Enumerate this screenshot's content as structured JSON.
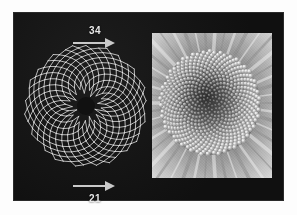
{
  "figure": {
    "caption_top_number": "34",
    "caption_bottom_number": "21",
    "background_color": "#ffffff",
    "plate_color": "#141414",
    "lattice_line_color": "#e6e6e6",
    "label_color": "#e8e8e8",
    "arrow_color": "#c9c9c9"
  },
  "lattice": {
    "name": "phyllotaxis-spiral-lattice",
    "description": "Spiral lattice diagram of a sunflower-type phyllotaxis pattern",
    "parastichy_counts": {
      "clockwise": "34",
      "counterclockwise": "21"
    },
    "center_disc_color": "#111111",
    "point_count": 340,
    "divergence_angle_degrees": 137.5
  },
  "photo": {
    "name": "flower-head-macro-photograph",
    "description": "Grayscale macro photograph of a composite flower head showing spiral floret arrangement",
    "palette": [
      "#0d0d0d",
      "#3a3a3a",
      "#787878",
      "#b5b5b5",
      "#e4e4e4"
    ]
  },
  "chart_data": {
    "type": "scatter",
    "title": "",
    "xlabel": "",
    "ylabel": "",
    "annotations": [
      {
        "text": "34",
        "position": "top",
        "arrow": "right"
      },
      {
        "text": "21",
        "position": "bottom",
        "arrow": "right"
      }
    ],
    "series": [
      {
        "name": "clockwise-parastichies",
        "values": [
          34
        ]
      },
      {
        "name": "counterclockwise-parastichies",
        "values": [
          21
        ]
      }
    ],
    "legend": "none",
    "grid": false
  }
}
